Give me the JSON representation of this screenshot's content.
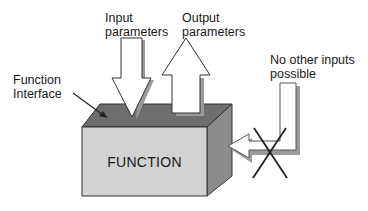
{
  "diagram": {
    "labels": {
      "input": "Input\nparameters",
      "output": "Output\nparameters",
      "interface": "Function\nInterface",
      "no_other": "No other inputs\npossible",
      "function": "FUNCTION"
    },
    "colors": {
      "top_face": "#6e6e6e",
      "front_face": "#d2d2d2",
      "side_face": "#8c8c8c",
      "arrow_fill": "#ffffff",
      "arrow_shadow": "#9a9a9a",
      "outline": "#333333"
    }
  }
}
